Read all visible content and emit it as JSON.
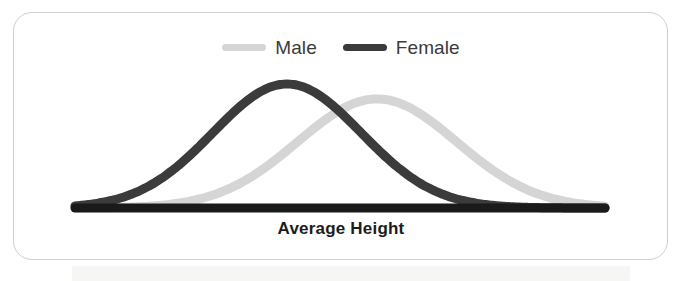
{
  "card": {
    "border_color": "#cfcfcf",
    "background": "#ffffff"
  },
  "legend": {
    "position": "top-center",
    "items": [
      {
        "label": "Male",
        "color": "#d5d5d5",
        "swatch_name": "legend-swatch-male"
      },
      {
        "label": "Female",
        "color": "#3b3b3b",
        "swatch_name": "legend-swatch-female"
      }
    ]
  },
  "axis": {
    "x_label": "Average Height",
    "baseline_color": "#1a1a1a"
  },
  "chart_data": {
    "type": "line",
    "title": "",
    "subtitle": "",
    "xlabel": "Average Height",
    "ylabel": "",
    "grid": false,
    "legend_position": "top-center",
    "axis_ticks": [],
    "x": [
      0,
      5,
      10,
      15,
      20,
      25,
      30,
      35,
      40,
      45,
      50,
      55,
      60,
      65,
      70,
      75,
      80,
      85,
      90,
      95,
      100
    ],
    "series": [
      {
        "name": "Female",
        "color": "#3b3b3b",
        "mean": 40,
        "std": 14,
        "peak_value": 100,
        "values": [
          0.7,
          2.0,
          5.0,
          11.0,
          21.4,
          36.2,
          54.6,
          73.1,
          88.7,
          98.0,
          100.0,
          94.2,
          82.0,
          66.0,
          48.8,
          33.0,
          20.4,
          11.6,
          6.0,
          2.8,
          1.2
        ]
      },
      {
        "name": "Male",
        "color": "#d5d5d5",
        "mean": 57,
        "std": 15,
        "peak_value": 88,
        "values": [
          0.3,
          0.8,
          1.9,
          4.2,
          8.4,
          15.6,
          26.4,
          40.6,
          56.6,
          71.9,
          83.2,
          88.0,
          85.8,
          77.4,
          64.6,
          50.0,
          35.8,
          23.6,
          14.4,
          8.2,
          4.3
        ]
      }
    ]
  }
}
